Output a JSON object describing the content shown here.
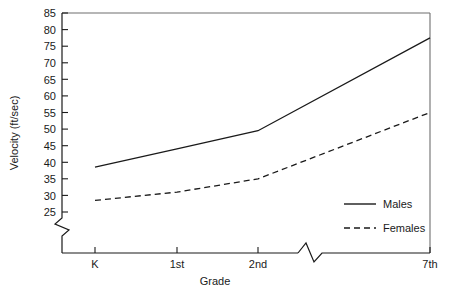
{
  "chart_data": {
    "type": "line",
    "title": "",
    "xlabel": "Grade",
    "ylabel": "Velocity (ft/sec)",
    "categories": [
      "K",
      "1st",
      "2nd",
      "7th"
    ],
    "series": [
      {
        "name": "Males",
        "style": "solid",
        "values": [
          38.5,
          44,
          49.5,
          77.5
        ]
      },
      {
        "name": "Females",
        "style": "dashed",
        "values": [
          28.5,
          31,
          35,
          55
        ]
      }
    ],
    "ylim": [
      25,
      85
    ],
    "yticks": [
      25,
      30,
      35,
      40,
      45,
      50,
      55,
      60,
      65,
      70,
      75,
      80,
      85
    ],
    "ytick_labels": [
      "25",
      "30",
      "35",
      "40",
      "45",
      "50",
      "55",
      "60",
      "65",
      "70",
      "75",
      "80",
      "85"
    ],
    "xtick_labels": [
      "K",
      "1st",
      "2nd",
      "7th"
    ],
    "grid": false,
    "legend_position": "bottom-right",
    "y_axis_break": true,
    "x_axis_break": true,
    "x_axis_break_between": [
      "2nd",
      "7th"
    ],
    "line_color": "#1a1a1a",
    "axis_color": "#1a1a1a",
    "background_color": "#ffffff"
  },
  "axes": {
    "y_title": "Velocity (ft/sec)",
    "x_title": "Grade"
  },
  "legend": {
    "males_label": "Males",
    "females_label": "Females"
  },
  "yticks": {
    "t85": "85",
    "t80": "80",
    "t75": "75",
    "t70": "70",
    "t65": "65",
    "t60": "60",
    "t55": "55",
    "t50": "50",
    "t45": "45",
    "t40": "40",
    "t35": "35",
    "t30": "30",
    "t25": "25"
  },
  "xticks": {
    "k": "K",
    "first": "1st",
    "second": "2nd",
    "seventh": "7th"
  }
}
